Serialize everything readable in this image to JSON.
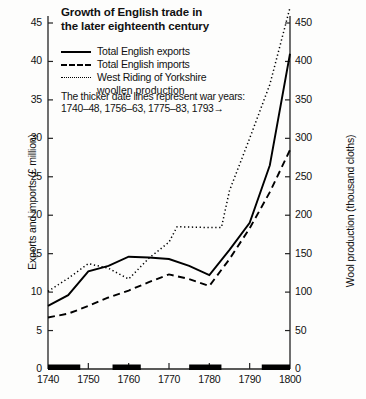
{
  "chart_data": {
    "type": "line",
    "title": "Growth of English trade in the later eighteenth century",
    "title_lines": [
      "Growth of English trade in",
      "the later eighteenth century"
    ],
    "note": "The thicker date lines represent war years:",
    "note_line2": "1740–48, 1756–63, 1775–83, 1793→",
    "xlabel": "",
    "ylabel": "Exports and imports (£ million)",
    "y2label": "Wool production (thousand cloths)",
    "xlim": [
      1740,
      1800
    ],
    "ylim": [
      0,
      45
    ],
    "y2lim": [
      0,
      450
    ],
    "xticks": [
      1740,
      1750,
      1760,
      1770,
      1780,
      1790,
      1800
    ],
    "yticks": [
      0,
      5,
      10,
      15,
      20,
      25,
      30,
      35,
      40,
      45
    ],
    "y2ticks": [
      0,
      50,
      100,
      150,
      200,
      250,
      300,
      350,
      400,
      450
    ],
    "grid": false,
    "legend_position": "top-left",
    "series": [
      {
        "name": "Total English exports",
        "style": "solid",
        "axis": "left",
        "units": "£ million",
        "points": [
          [
            1740,
            8.2
          ],
          [
            1745,
            9.6
          ],
          [
            1750,
            12.7
          ],
          [
            1755,
            13.4
          ],
          [
            1760,
            14.6
          ],
          [
            1765,
            14.5
          ],
          [
            1770,
            14.3
          ],
          [
            1775,
            13.4
          ],
          [
            1780,
            12.2
          ],
          [
            1785,
            15.5
          ],
          [
            1790,
            19.0
          ],
          [
            1795,
            26.5
          ],
          [
            1800,
            41.0
          ]
        ]
      },
      {
        "name": "Total English imports",
        "style": "dashed",
        "axis": "left",
        "units": "£ million",
        "points": [
          [
            1740,
            6.7
          ],
          [
            1745,
            7.2
          ],
          [
            1750,
            8.2
          ],
          [
            1755,
            9.3
          ],
          [
            1760,
            10.2
          ],
          [
            1765,
            11.3
          ],
          [
            1770,
            12.3
          ],
          [
            1775,
            11.7
          ],
          [
            1780,
            10.8
          ],
          [
            1785,
            14.3
          ],
          [
            1790,
            18.3
          ],
          [
            1795,
            23.0
          ],
          [
            1800,
            28.5
          ]
        ]
      },
      {
        "name": "West Riding of Yorkshire woollen production",
        "style": "dotted",
        "axis": "right",
        "units": "thousand cloths",
        "points": [
          [
            1740,
            101
          ],
          [
            1745,
            118
          ],
          [
            1750,
            137
          ],
          [
            1755,
            131
          ],
          [
            1760,
            117
          ],
          [
            1765,
            144
          ],
          [
            1770,
            165
          ],
          [
            1772,
            185
          ],
          [
            1780,
            184
          ],
          [
            1783,
            184
          ],
          [
            1785,
            232
          ],
          [
            1790,
            300
          ],
          [
            1795,
            370
          ],
          [
            1800,
            470
          ]
        ]
      }
    ],
    "war_bars": [
      {
        "label": "1740–48",
        "start": 1740,
        "end": 1748
      },
      {
        "label": "1756–63",
        "start": 1756,
        "end": 1763
      },
      {
        "label": "1775–83",
        "start": 1775,
        "end": 1783
      },
      {
        "label": "1793→",
        "start": 1793,
        "end": 1800
      }
    ],
    "colors": {
      "line": "#000000",
      "background": "#fdfdfc",
      "axis": "#222222"
    }
  },
  "legend": {
    "items": [
      {
        "label": "Total English exports",
        "style": "solid"
      },
      {
        "label": "Total English imports",
        "style": "dashed"
      },
      {
        "label": "West Riding of Yorkshire",
        "label2": "woollen production",
        "style": "dotted"
      }
    ]
  }
}
